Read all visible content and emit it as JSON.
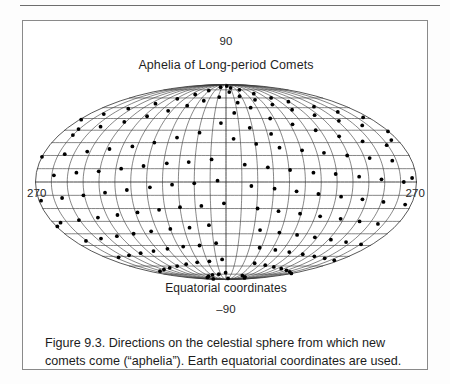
{
  "figure": {
    "top_label": "90",
    "title": "Aphelia of Long-period Comets",
    "left_label": "270",
    "right_label": "270",
    "xaxis_label": "Equatorial coordinates",
    "bottom_label": "–90",
    "caption": "Figure 9.3. Directions on the celestial sphere from which new comets come (“aphelia”). Earth equatorial coordinates are used."
  },
  "colors": {
    "line": "#3a3a3a",
    "point": "#000000",
    "background": "#ffffff",
    "border": "#8a8a8a",
    "text": "#1a1a1a"
  },
  "chart_data": {
    "type": "scatter",
    "projection": "mollweide",
    "title": "Aphelia of Long-period Comets",
    "xlabel": "Equatorial coordinates",
    "ylabel": "",
    "xlim": [
      90,
      450
    ],
    "ylim": [
      -90,
      90
    ],
    "grid": true,
    "legend_position": "none",
    "annotations": [
      "90",
      "270",
      "270",
      "–90",
      "Equatorial coordinates"
    ],
    "graticule": {
      "meridian_step_deg": 15,
      "parallel_step_deg": 10,
      "center_meridian_label": 270,
      "edge_meridian_labels": [
        90,
        450
      ]
    },
    "axis_tick_labels": {
      "top": "90",
      "bottom": "-90",
      "left": "270",
      "right": "270"
    },
    "point_count": 338,
    "point_radius_px": 1.9,
    "units": "degrees (right ascension, declination)",
    "points": [
      [
        4,
        86
      ],
      [
        17,
        83
      ],
      [
        -22,
        84
      ],
      [
        39,
        80
      ],
      [
        -47,
        79
      ],
      [
        8,
        77
      ],
      [
        62,
        75
      ],
      [
        -66,
        74
      ],
      [
        27,
        72
      ],
      [
        -13,
        71
      ],
      [
        84,
        70
      ],
      [
        -88,
        69
      ],
      [
        51,
        68
      ],
      [
        -38,
        67
      ],
      [
        104,
        66
      ],
      [
        19,
        65
      ],
      [
        -112,
        64
      ],
      [
        72,
        63
      ],
      [
        -59,
        62
      ],
      [
        131,
        61
      ],
      [
        36,
        60
      ],
      [
        -140,
        59
      ],
      [
        93,
        58
      ],
      [
        -80,
        57
      ],
      [
        152,
        56
      ],
      [
        11,
        55
      ],
      [
        -161,
        54
      ],
      [
        115,
        53
      ],
      [
        -101,
        52
      ],
      [
        173,
        51
      ],
      [
        55,
        50
      ],
      [
        -178,
        49
      ],
      [
        137,
        48
      ],
      [
        -122,
        47
      ],
      [
        -6,
        46
      ],
      [
        78,
        45
      ],
      [
        158,
        44
      ],
      [
        -144,
        43
      ],
      [
        27,
        42
      ],
      [
        -166,
        41
      ],
      [
        100,
        40
      ],
      [
        179,
        39
      ],
      [
        -29,
        38
      ],
      [
        49,
        37
      ],
      [
        -165,
        36
      ],
      [
        121,
        35
      ],
      [
        -52,
        34
      ],
      [
        8,
        33
      ],
      [
        -187,
        32
      ],
      [
        142,
        31
      ],
      [
        -74,
        30
      ],
      [
        31,
        29
      ],
      [
        164,
        28
      ],
      [
        -95,
        27
      ],
      [
        54,
        26
      ],
      [
        -117,
        25
      ],
      [
        76,
        24
      ],
      [
        -138,
        23
      ],
      [
        97,
        22
      ],
      [
        -159,
        21
      ],
      [
        119,
        20
      ],
      [
        -180,
        19
      ],
      [
        140,
        18
      ],
      [
        -14,
        17
      ],
      [
        161,
        16
      ],
      [
        -36,
        15
      ],
      [
        -57,
        14
      ],
      [
        18,
        13
      ],
      [
        -79,
        12
      ],
      [
        40,
        11
      ],
      [
        -100,
        10
      ],
      [
        61,
        9
      ],
      [
        -121,
        8
      ],
      [
        83,
        7
      ],
      [
        -142,
        7
      ],
      [
        104,
        6
      ],
      [
        -163,
        5
      ],
      [
        126,
        4
      ],
      [
        -184,
        3
      ],
      [
        147,
        2
      ],
      [
        -8,
        1
      ],
      [
        168,
        0
      ],
      [
        -30,
        -1
      ],
      [
        -51,
        -2
      ],
      [
        24,
        -3
      ],
      [
        -72,
        -4
      ],
      [
        46,
        -5
      ],
      [
        -94,
        -6
      ],
      [
        67,
        -7
      ],
      [
        -115,
        -8
      ],
      [
        88,
        -9
      ],
      [
        -136,
        -10
      ],
      [
        110,
        -11
      ],
      [
        -157,
        -12
      ],
      [
        131,
        -13
      ],
      [
        -178,
        -14
      ],
      [
        152,
        -15
      ],
      [
        -2,
        -16
      ],
      [
        174,
        -17
      ],
      [
        -24,
        -18
      ],
      [
        -45,
        -19
      ],
      [
        31,
        -20
      ],
      [
        -66,
        -21
      ],
      [
        52,
        -22
      ],
      [
        -88,
        -23
      ],
      [
        74,
        -24
      ],
      [
        -109,
        -25
      ],
      [
        95,
        -26
      ],
      [
        -130,
        -27
      ],
      [
        117,
        -28
      ],
      [
        -151,
        -29
      ],
      [
        138,
        -30
      ],
      [
        -172,
        -31
      ],
      [
        159,
        -32
      ],
      [
        -18,
        -33
      ],
      [
        181,
        -34
      ],
      [
        -39,
        -35
      ],
      [
        -60,
        -36
      ],
      [
        37,
        -37
      ],
      [
        -82,
        -38
      ],
      [
        59,
        -39
      ],
      [
        -103,
        -40
      ],
      [
        80,
        -41
      ],
      [
        -124,
        -42
      ],
      [
        102,
        -43
      ],
      [
        -145,
        -44
      ],
      [
        123,
        -45
      ],
      [
        -166,
        -46
      ],
      [
        144,
        -47
      ],
      [
        -12,
        -48
      ],
      [
        166,
        -49
      ],
      [
        -33,
        -50
      ],
      [
        -54,
        -51
      ],
      [
        43,
        -52
      ],
      [
        -76,
        -53
      ],
      [
        65,
        -54
      ],
      [
        -97,
        -55
      ],
      [
        86,
        -56
      ],
      [
        -118,
        -57
      ],
      [
        108,
        -58
      ],
      [
        -139,
        -59
      ],
      [
        129,
        -60
      ],
      [
        -160,
        -61
      ],
      [
        150,
        -62
      ],
      [
        -6,
        -63
      ],
      [
        172,
        -64
      ],
      [
        -27,
        -65
      ],
      [
        -48,
        -66
      ],
      [
        49,
        -67
      ],
      [
        -70,
        -68
      ],
      [
        71,
        -69
      ],
      [
        -91,
        -70
      ],
      [
        92,
        -71
      ],
      [
        -112,
        -72
      ],
      [
        114,
        -73
      ],
      [
        -133,
        -74
      ],
      [
        135,
        -75
      ],
      [
        -154,
        -76
      ],
      [
        156,
        -77
      ],
      [
        -1,
        -78
      ],
      [
        178,
        -79
      ],
      [
        -21,
        -80
      ],
      [
        -42,
        -81
      ],
      [
        55,
        -82
      ],
      [
        -64,
        -83
      ],
      [
        77,
        -84
      ],
      [
        -85,
        -85
      ],
      [
        98,
        -86
      ],
      [
        13,
        -87
      ],
      [
        -106,
        -88
      ]
    ]
  }
}
